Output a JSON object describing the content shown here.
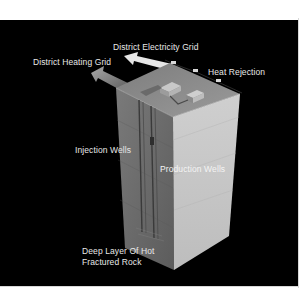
{
  "diagram": {
    "background_color": "#000000",
    "labels": {
      "electricity_grid": "District Electricity Grid",
      "heating_grid": "District Heating Grid",
      "heat_rejection": "Heat Rejection",
      "injection_wells": "Injection Wells",
      "production_wells": "Production Wells",
      "hot_rock_line1": "Deep Layer Of Hot",
      "hot_rock_line2": "Fractured Rock"
    },
    "colors": {
      "top_face": "#8a8a8a",
      "left_face": "#6e6e6e",
      "right_face": "#c9c9c9",
      "arrow_electricity": "#e6e6e6",
      "arrow_heating": "#9a9a9a",
      "label_text": "#e8e8e8"
    }
  }
}
